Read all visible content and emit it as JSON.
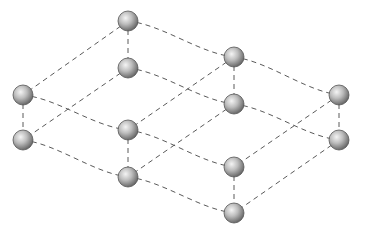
{
  "diagram": {
    "title": "",
    "colors": {
      "background": "#ffffff",
      "edge": "#5a5a5a",
      "sphere_light": "#f2f2f2",
      "sphere_mid": "#a8a8a8",
      "sphere_dark": "#5e5e5e"
    },
    "node_radius": 10,
    "nodes": [
      {
        "id": "A",
        "x": 128,
        "y": 21
      },
      {
        "id": "B",
        "x": 234,
        "y": 57
      },
      {
        "id": "C",
        "x": 339,
        "y": 95
      },
      {
        "id": "D",
        "x": 23,
        "y": 95
      },
      {
        "id": "E",
        "x": 128,
        "y": 130
      },
      {
        "id": "F",
        "x": 234,
        "y": 167
      },
      {
        "id": "A2",
        "x": 128,
        "y": 68
      },
      {
        "id": "B2",
        "x": 234,
        "y": 104
      },
      {
        "id": "C2",
        "x": 339,
        "y": 140
      },
      {
        "id": "D2",
        "x": 23,
        "y": 140
      },
      {
        "id": "E2",
        "x": 128,
        "y": 177
      },
      {
        "id": "F2",
        "x": 234,
        "y": 213
      }
    ],
    "edges": [
      {
        "from": "A",
        "to": "B",
        "curve": 8
      },
      {
        "from": "B",
        "to": "C",
        "curve": 8
      },
      {
        "from": "D",
        "to": "E",
        "curve": 8
      },
      {
        "from": "E",
        "to": "F",
        "curve": 8
      },
      {
        "from": "A",
        "to": "D",
        "curve": 0
      },
      {
        "from": "B",
        "to": "E",
        "curve": 0
      },
      {
        "from": "C",
        "to": "F",
        "curve": 0
      },
      {
        "from": "A2",
        "to": "B2",
        "curve": 8
      },
      {
        "from": "B2",
        "to": "C2",
        "curve": 8
      },
      {
        "from": "D2",
        "to": "E2",
        "curve": 8
      },
      {
        "from": "E2",
        "to": "F2",
        "curve": 8
      },
      {
        "from": "A2",
        "to": "D2",
        "curve": 0
      },
      {
        "from": "B2",
        "to": "E2",
        "curve": 0
      },
      {
        "from": "C2",
        "to": "F2",
        "curve": 0
      },
      {
        "from": "A",
        "to": "A2",
        "curve": 0
      },
      {
        "from": "B",
        "to": "B2",
        "curve": 0
      },
      {
        "from": "C",
        "to": "C2",
        "curve": 0
      },
      {
        "from": "D",
        "to": "D2",
        "curve": 0
      },
      {
        "from": "E",
        "to": "E2",
        "curve": 0
      },
      {
        "from": "F",
        "to": "F2",
        "curve": 0
      }
    ]
  }
}
